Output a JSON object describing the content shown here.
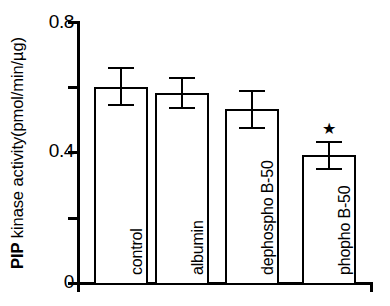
{
  "chart_data": {
    "type": "bar",
    "title": "",
    "subtitle": "",
    "xlabel": "",
    "ylabel": "PIP kinase activity(pmol/min/µg)",
    "ylabel_bold_prefix": "PIP",
    "ylabel_rest": " kinase activity(pmol/min/µg)",
    "categories": [
      "control",
      "albumin",
      "dephospho B-50",
      "phopho B-50"
    ],
    "values": [
      0.6,
      0.58,
      0.53,
      0.39
    ],
    "errors": [
      0.06,
      0.05,
      0.06,
      0.045
    ],
    "ylim": [
      0,
      0.8
    ],
    "yticks": [
      0,
      0.2,
      0.4,
      0.6,
      0.8
    ],
    "ytick_labels": [
      "0",
      "",
      "0.4",
      "",
      "0.8"
    ],
    "grid": false,
    "legend": "none",
    "annotations": [
      {
        "text": "★",
        "target_category": "phopho B-50",
        "meaning": "significance-marker"
      }
    ],
    "bar_fill": "#ffffff",
    "bar_edge": "#000000"
  },
  "axis": {
    "y_top_label": "0.8",
    "y_mid_label": "0.4",
    "y_zero_label": "0"
  },
  "series_labels": {
    "bar_0": "control",
    "bar_1": "albumin",
    "bar_2": "dephospho B-50",
    "bar_3": "phopho B-50"
  },
  "marker": {
    "star_glyph": "★"
  }
}
